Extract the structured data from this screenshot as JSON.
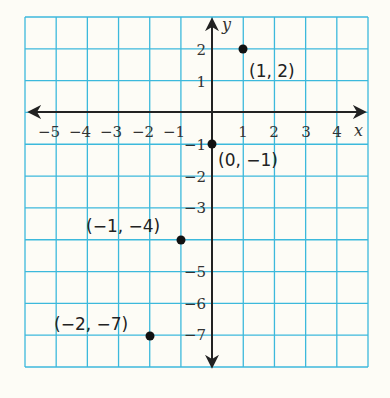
{
  "chart_data": {
    "type": "scatter",
    "title": "",
    "xlabel": "x",
    "ylabel": "y",
    "xlim": [
      -6,
      5
    ],
    "ylim": [
      -8,
      3
    ],
    "grid": true,
    "x_ticks": [
      "-5",
      "-4",
      "-3",
      "-2",
      "-1",
      "1",
      "2",
      "3",
      "4"
    ],
    "y_ticks": [
      "2",
      "1",
      "-1",
      "-2",
      "-3",
      "-5",
      "-6",
      "-7"
    ],
    "points": [
      {
        "x": 1,
        "y": 2,
        "label": "(1, 2)"
      },
      {
        "x": 0,
        "y": -1,
        "label": "(0, −1)"
      },
      {
        "x": -1,
        "y": -4,
        "label": "(−1, −4)"
      },
      {
        "x": -2,
        "y": -7,
        "label": "(−2, −7)"
      }
    ],
    "colors": {
      "grid": "#3cb9dc",
      "axis": "#222222",
      "point": "#111111",
      "background": "#fdfcf6"
    }
  },
  "labels": {
    "x_axis": "x",
    "y_axis": "y",
    "x_ticks": [
      "−5",
      "−4",
      "−3",
      "−2",
      "−1",
      "1",
      "2",
      "3",
      "4"
    ],
    "y_ticks": [
      "2",
      "1",
      "−1",
      "−2",
      "−3",
      "−5",
      "−6",
      "−7"
    ],
    "points": [
      "(1, 2)",
      "(0, −1)",
      "(−1, −4)",
      "(−2, −7)"
    ]
  }
}
